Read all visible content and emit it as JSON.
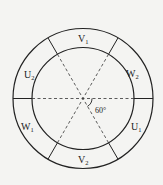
{
  "diagram": {
    "type": "stator-winding-layout",
    "center": {
      "x": 83,
      "y": 98.5
    },
    "outer_radius": 70,
    "inner_radius": 51,
    "colors": {
      "stroke": "#222222",
      "background": "#f4f4f2"
    },
    "angle_label": "60°",
    "segments": [
      {
        "id": "V1",
        "main": "V",
        "sub": "1",
        "angle_deg": 90
      },
      {
        "id": "W2",
        "main": "W",
        "sub": "2",
        "angle_deg": 30
      },
      {
        "id": "U1",
        "main": "U",
        "sub": "1",
        "angle_deg": -30
      },
      {
        "id": "V2",
        "main": "V",
        "sub": "2",
        "angle_deg": -90
      },
      {
        "id": "W1",
        "main": "W",
        "sub": "1",
        "angle_deg": -150
      },
      {
        "id": "U2",
        "main": "U",
        "sub": "2",
        "angle_deg": 150
      }
    ]
  }
}
